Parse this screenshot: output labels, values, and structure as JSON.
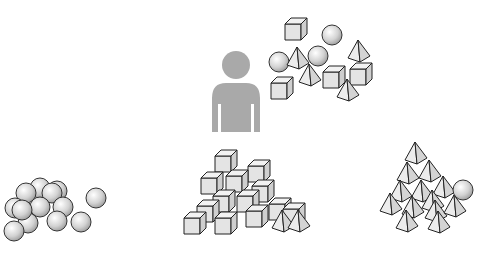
{
  "diagram": {
    "person": {
      "icon": "person-silhouette-icon",
      "color": "#a9a9a9"
    },
    "mixed_objects": {
      "shapes": [
        "cube",
        "sphere",
        "pyramid"
      ]
    },
    "clusters": [
      {
        "name": "spheres",
        "shape": "sphere",
        "count": 13
      },
      {
        "name": "cubes",
        "shape": "cube",
        "count": 18
      },
      {
        "name": "pyramids",
        "shape": "pyramid",
        "count": 17,
        "outlier": "sphere"
      }
    ],
    "colors": {
      "fill_light": "#e6e6e6",
      "fill_dark": "#c8c8c8",
      "stroke": "#222222"
    }
  }
}
